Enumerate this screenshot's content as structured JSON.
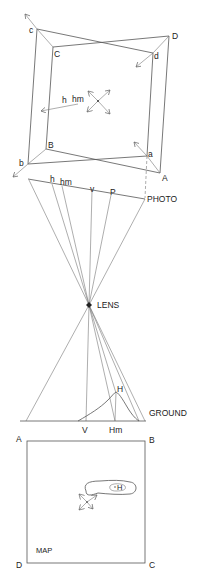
{
  "diagram": {
    "photo_frame": {
      "outer_corners": {
        "a": "a",
        "b": "b",
        "c": "c",
        "d": "d"
      },
      "inner_corners": {
        "A": "A",
        "B": "B",
        "C": "C",
        "D": "D"
      },
      "center_labels": {
        "h": "h",
        "hm": "hm"
      }
    },
    "photo_plane": {
      "label": "PHOTO",
      "points": {
        "h": "h",
        "hm": "hm",
        "v": "v",
        "P": "P"
      }
    },
    "lens": {
      "label": "LENS"
    },
    "ground": {
      "label": "GROUND",
      "points": {
        "V": "V",
        "Hm": "Hm",
        "H": "H"
      }
    },
    "map": {
      "label": "MAP",
      "corners": {
        "A": "A",
        "B": "B",
        "C": "C",
        "D": "D"
      },
      "feature_label": "H"
    },
    "colors": {
      "line": "#555555",
      "text": "#222222",
      "background": "#ffffff"
    }
  }
}
